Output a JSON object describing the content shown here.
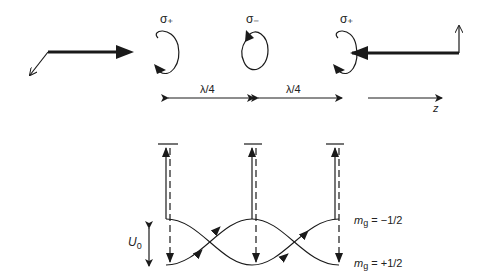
{
  "diagram": {
    "polarizations": [
      {
        "label": "σ₊",
        "name": "sigma-plus",
        "rotation": "ccw"
      },
      {
        "label": "σ₋",
        "name": "sigma-minus",
        "rotation": "cw"
      },
      {
        "label": "σ₊",
        "name": "sigma-plus",
        "rotation": "ccw"
      }
    ],
    "spacing_labels": [
      "λ/4",
      "λ/4"
    ],
    "axis_label": "z",
    "levels": {
      "upper": "m_g = −1/2",
      "lower": "m_g = +1/2",
      "upper_m": "m",
      "upper_sub": "g",
      "upper_val": " = −1/2",
      "lower_m": "m",
      "lower_sub": "g",
      "lower_val": " = +1/2"
    },
    "depth_label": "U",
    "depth_sub": "0",
    "colors": {
      "ink": "#1a1a1a"
    }
  }
}
